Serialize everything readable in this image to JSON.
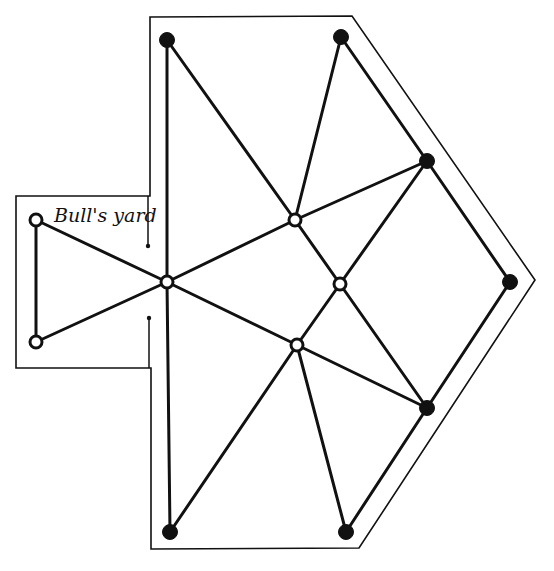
{
  "board": {
    "label": "Bull's yard",
    "colors": {
      "ink": "#111111",
      "background": "#ffffff"
    },
    "outline": {
      "main_polygon": [
        [
          150,
          17
        ],
        [
          352,
          16
        ],
        [
          535,
          280
        ],
        [
          359,
          548
        ],
        [
          151,
          549
        ],
        [
          151,
          368
        ],
        [
          16,
          368
        ],
        [
          16,
          196
        ],
        [
          150,
          196
        ]
      ],
      "yard_divider_ticks": [
        {
          "x": 148,
          "y1": 196,
          "y2": 246
        },
        {
          "x": 149,
          "y1": 318,
          "y2": 368
        }
      ]
    },
    "nodes": [
      {
        "id": "n1",
        "x": 167,
        "y": 40,
        "type": "filled"
      },
      {
        "id": "n2",
        "x": 341,
        "y": 37,
        "type": "filled"
      },
      {
        "id": "n3",
        "x": 427,
        "y": 161,
        "type": "filled"
      },
      {
        "id": "n4",
        "x": 510,
        "y": 282,
        "type": "filled"
      },
      {
        "id": "n5",
        "x": 427,
        "y": 408,
        "type": "filled"
      },
      {
        "id": "n6",
        "x": 346,
        "y": 532,
        "type": "filled"
      },
      {
        "id": "n7",
        "x": 170,
        "y": 532,
        "type": "filled"
      },
      {
        "id": "n8",
        "x": 295,
        "y": 220,
        "type": "open"
      },
      {
        "id": "n9",
        "x": 340,
        "y": 284,
        "type": "open"
      },
      {
        "id": "n10",
        "x": 297,
        "y": 345,
        "type": "open"
      },
      {
        "id": "n11",
        "x": 167,
        "y": 282,
        "type": "open"
      },
      {
        "id": "n12",
        "x": 36,
        "y": 220,
        "type": "open"
      },
      {
        "id": "n13",
        "x": 36,
        "y": 342,
        "type": "open"
      }
    ],
    "edges": [
      [
        "n1",
        "n11"
      ],
      [
        "n1",
        "n8"
      ],
      [
        "n2",
        "n8"
      ],
      [
        "n2",
        "n3"
      ],
      [
        "n3",
        "n8"
      ],
      [
        "n3",
        "n9"
      ],
      [
        "n3",
        "n4"
      ],
      [
        "n4",
        "n5"
      ],
      [
        "n5",
        "n6"
      ],
      [
        "n5",
        "n9"
      ],
      [
        "n5",
        "n10"
      ],
      [
        "n6",
        "n10"
      ],
      [
        "n7",
        "n10"
      ],
      [
        "n7",
        "n11"
      ],
      [
        "n8",
        "n9"
      ],
      [
        "n8",
        "n11"
      ],
      [
        "n9",
        "n10"
      ],
      [
        "n10",
        "n11"
      ],
      [
        "n11",
        "n12"
      ],
      [
        "n11",
        "n13"
      ],
      [
        "n12",
        "n13"
      ]
    ]
  }
}
